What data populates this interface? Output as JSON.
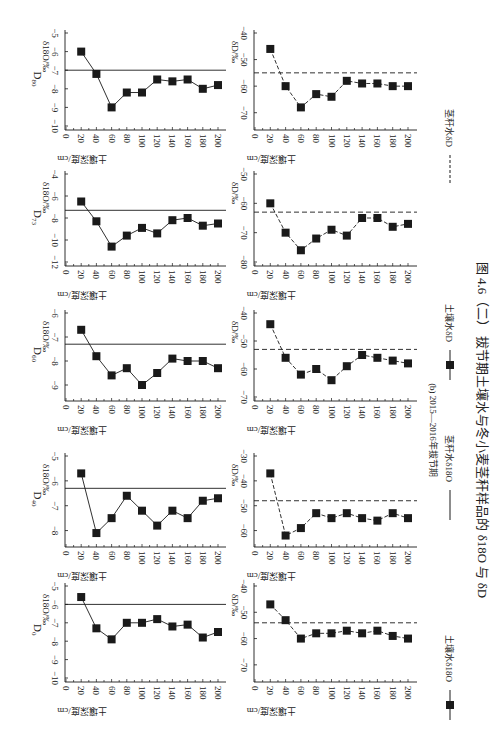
{
  "figure": {
    "caption": "图 4.6（二） 拔节期土壤水与冬小麦茎秆样品的 δ18O 与 δD",
    "subcaption": "(b) 2015—2016年拔节期",
    "xlabel": "土壤深度/cm",
    "ylabel_o": "δ18O/‰",
    "ylabel_d": "δD/‰",
    "legend": [
      {
        "label": "土壤水δ18O",
        "style": "solid-square"
      },
      {
        "label": "茎秆水δ18O",
        "style": "solid-line"
      },
      {
        "label": "土壤水δD",
        "style": "dashed-square"
      },
      {
        "label": "茎秆水δD",
        "style": "dashed-line"
      }
    ],
    "colors": {
      "ink": "#1a1a1a",
      "background": "#ffffff"
    }
  },
  "chart_data": [
    {
      "type": "line",
      "panel": "D80",
      "variable": "δ18O",
      "x": [
        20,
        40,
        60,
        80,
        100,
        120,
        140,
        160,
        180,
        200
      ],
      "values": [
        -6.0,
        -7.2,
        -9.0,
        -8.2,
        -8.2,
        -7.5,
        -7.6,
        -7.5,
        -8.0,
        -7.8
      ],
      "stem_value": -7.0,
      "ylim": [
        -10,
        -5
      ],
      "yticks": [
        -10,
        -9,
        -8,
        -7,
        -6,
        -5
      ],
      "xticks": [
        0,
        20,
        40,
        60,
        80,
        100,
        120,
        140,
        160,
        180,
        200
      ]
    },
    {
      "type": "line",
      "panel": "D80",
      "variable": "δD",
      "x": [
        20,
        40,
        60,
        80,
        100,
        120,
        140,
        160,
        180,
        200
      ],
      "values": [
        -46,
        -60,
        -68,
        -63,
        -64,
        -58,
        -59,
        -59,
        -60,
        -60
      ],
      "stem_value": -55,
      "ylim": [
        -75,
        -40
      ],
      "yticks": [
        -70,
        -60,
        -50,
        -40
      ]
    },
    {
      "type": "line",
      "panel": "D73",
      "variable": "δ18O",
      "x": [
        20,
        40,
        60,
        80,
        100,
        120,
        140,
        160,
        180,
        200
      ],
      "values": [
        -6.5,
        -8.3,
        -10.6,
        -9.6,
        -8.9,
        -9.4,
        -8.2,
        -8.0,
        -8.7,
        -8.5
      ],
      "stem_value": -7.3,
      "ylim": [
        -12,
        -4
      ],
      "yticks": [
        -12,
        -10,
        -8,
        -6,
        -4
      ]
    },
    {
      "type": "line",
      "panel": "D73",
      "variable": "δD",
      "x": [
        20,
        40,
        60,
        80,
        100,
        120,
        140,
        160,
        180,
        200
      ],
      "values": [
        -60,
        -70,
        -76,
        -72,
        -69,
        -71,
        -65,
        -65,
        -68,
        -67
      ],
      "stem_value": -63,
      "ylim": [
        -80,
        -50
      ],
      "yticks": [
        -80,
        -70,
        -60,
        -50
      ]
    },
    {
      "type": "line",
      "panel": "D60",
      "variable": "δ18O",
      "x": [
        20,
        40,
        60,
        80,
        100,
        120,
        140,
        160,
        180,
        200
      ],
      "values": [
        -6.7,
        -7.8,
        -8.6,
        -8.3,
        -9.0,
        -8.5,
        -7.9,
        -8.0,
        -8.0,
        -8.3
      ],
      "stem_value": -7.3,
      "ylim": [
        -9.5,
        -6
      ],
      "yticks": [
        -9,
        -8,
        -7,
        -6
      ]
    },
    {
      "type": "line",
      "panel": "D60",
      "variable": "δD",
      "x": [
        20,
        40,
        60,
        80,
        100,
        120,
        140,
        160,
        180,
        200
      ],
      "values": [
        -44,
        -56,
        -62,
        -60,
        -64,
        -59,
        -55,
        -56,
        -57,
        -58
      ],
      "stem_value": -53,
      "ylim": [
        -70,
        -40
      ],
      "yticks": [
        -70,
        -60,
        -50,
        -40
      ]
    },
    {
      "type": "line",
      "panel": "D40",
      "variable": "δ18O",
      "x": [
        20,
        40,
        60,
        80,
        100,
        120,
        140,
        160,
        180,
        200
      ],
      "values": [
        -5.7,
        -8.1,
        -7.5,
        -6.6,
        -7.2,
        -7.8,
        -7.2,
        -7.5,
        -6.8,
        -6.7
      ],
      "stem_value": -6.3,
      "ylim": [
        -8.5,
        -5
      ],
      "yticks": [
        -8,
        -7,
        -6,
        -5
      ]
    },
    {
      "type": "line",
      "panel": "D40",
      "variable": "δD",
      "x": [
        20,
        40,
        60,
        80,
        100,
        120,
        140,
        160,
        180,
        200
      ],
      "values": [
        -37,
        -62,
        -59,
        -53,
        -55,
        -53,
        -55,
        -56,
        -53,
        -55
      ],
      "stem_value": -48,
      "ylim": [
        -65,
        -30
      ],
      "yticks": [
        -60,
        -50,
        -40,
        -30
      ]
    },
    {
      "type": "line",
      "panel": "D0",
      "variable": "δ18O",
      "x": [
        20,
        40,
        60,
        80,
        100,
        120,
        140,
        160,
        180,
        200
      ],
      "values": [
        -5.6,
        -7.3,
        -7.9,
        -7.0,
        -7.0,
        -6.8,
        -7.2,
        -7.1,
        -7.8,
        -7.5
      ],
      "stem_value": -6.0,
      "ylim": [
        -10,
        -5
      ],
      "yticks": [
        -10,
        -9,
        -8,
        -7,
        -6,
        -5
      ]
    },
    {
      "type": "line",
      "panel": "D0",
      "variable": "δD",
      "x": [
        20,
        40,
        60,
        80,
        100,
        120,
        140,
        160,
        180,
        200
      ],
      "values": [
        -47,
        -53,
        -60,
        -58,
        -58,
        -57,
        -58,
        -57,
        -59,
        -60
      ],
      "stem_value": -54,
      "ylim": [
        -75,
        -40
      ],
      "yticks": [
        -70,
        -60,
        -50,
        -40
      ]
    }
  ],
  "panels": [
    {
      "name": "D80",
      "label": "D",
      "sub": "80"
    },
    {
      "name": "D73",
      "label": "D",
      "sub": "73"
    },
    {
      "name": "D60",
      "label": "D",
      "sub": "60"
    },
    {
      "name": "D40",
      "label": "D",
      "sub": "40"
    },
    {
      "name": "D0",
      "label": "D",
      "sub": "0"
    }
  ]
}
